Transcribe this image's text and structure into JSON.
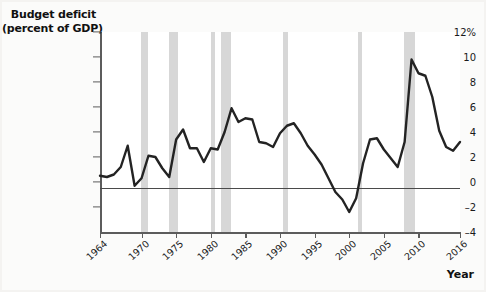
{
  "chart_data": {
    "type": "line",
    "title": "Budget deficit (percent of GDP)",
    "title_line1": "Budget deficit",
    "title_line2": "(percent of GDP)",
    "xlabel": "Year",
    "ylabel": "Budget deficit (percent of GDP)",
    "xlim": [
      1964,
      2016
    ],
    "ylim": [
      -4,
      12
    ],
    "grid": false,
    "legend": null,
    "y_ticks": [
      {
        "value": 12,
        "label": "12%"
      },
      {
        "value": 10,
        "label": "10"
      },
      {
        "value": 8,
        "label": "8"
      },
      {
        "value": 6,
        "label": "6"
      },
      {
        "value": 4,
        "label": "4"
      },
      {
        "value": 2,
        "label": "2"
      },
      {
        "value": 0,
        "label": "0"
      },
      {
        "value": -2,
        "label": "–2"
      },
      {
        "value": -4,
        "label": "–4"
      }
    ],
    "x_ticks": [
      {
        "value": 1964,
        "label": "1964"
      },
      {
        "value": 1970,
        "label": "1970"
      },
      {
        "value": 1975,
        "label": "1975"
      },
      {
        "value": 1980,
        "label": "1980"
      },
      {
        "value": 1985,
        "label": "1985"
      },
      {
        "value": 1990,
        "label": "1990"
      },
      {
        "value": 1995,
        "label": "1995"
      },
      {
        "value": 2000,
        "label": "2000"
      },
      {
        "value": 2005,
        "label": "2005"
      },
      {
        "value": 2010,
        "label": "2010"
      },
      {
        "value": 2016,
        "label": "2016"
      }
    ],
    "zero_reference_line": 0,
    "recession_bands": [
      {
        "start": 1969.9,
        "end": 1970.9
      },
      {
        "start": 1973.9,
        "end": 1975.2
      },
      {
        "start": 1980.0,
        "end": 1980.6
      },
      {
        "start": 1981.5,
        "end": 1982.9
      },
      {
        "start": 1990.5,
        "end": 1991.2
      },
      {
        "start": 2001.2,
        "end": 2001.9
      },
      {
        "start": 2007.9,
        "end": 2009.5
      }
    ],
    "series": [
      {
        "name": "Budget deficit (percent of GDP)",
        "color": "#232323",
        "x": [
          1964,
          1965,
          1966,
          1967,
          1968,
          1969,
          1970,
          1971,
          1972,
          1973,
          1974,
          1975,
          1976,
          1977,
          1978,
          1979,
          1980,
          1981,
          1982,
          1983,
          1984,
          1985,
          1986,
          1987,
          1988,
          1989,
          1990,
          1991,
          1992,
          1993,
          1994,
          1995,
          1996,
          1997,
          1998,
          1999,
          2000,
          2001,
          2002,
          2003,
          2004,
          2005,
          2006,
          2007,
          2008,
          2009,
          2010,
          2011,
          2012,
          2013,
          2014,
          2015,
          2016
        ],
        "values": [
          0.5,
          0.4,
          0.6,
          1.2,
          2.9,
          -0.3,
          0.3,
          2.1,
          2.0,
          1.1,
          0.4,
          3.4,
          4.2,
          2.7,
          2.7,
          1.6,
          2.7,
          2.6,
          4.0,
          5.9,
          4.8,
          5.1,
          5.0,
          3.2,
          3.1,
          2.8,
          3.9,
          4.5,
          4.7,
          3.9,
          2.9,
          2.2,
          1.4,
          0.3,
          -0.8,
          -1.4,
          -2.4,
          -1.3,
          1.5,
          3.4,
          3.5,
          2.6,
          1.9,
          1.2,
          3.2,
          9.8,
          8.7,
          8.5,
          6.8,
          4.1,
          2.8,
          2.5,
          3.2
        ]
      }
    ]
  }
}
